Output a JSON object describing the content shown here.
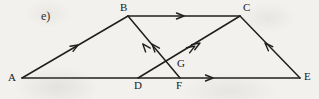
{
  "figure": {
    "part_label": "e)",
    "width": 319,
    "height": 99,
    "background_color": "#f2f1ee",
    "ink_color": "#1f1f1f"
  },
  "vertices": [
    {
      "id": "A",
      "label": "A",
      "x": 22,
      "y": 78,
      "label_x": 8,
      "label_y": 73
    },
    {
      "id": "B",
      "label": "B",
      "x": 128,
      "y": 16,
      "label_x": 120,
      "label_y": 3
    },
    {
      "id": "C",
      "label": "C",
      "x": 240,
      "y": 16,
      "label_x": 243,
      "label_y": 3
    },
    {
      "id": "D",
      "label": "D",
      "x": 138,
      "y": 78,
      "label_x": 134,
      "label_y": 81
    },
    {
      "id": "E",
      "label": "E",
      "x": 300,
      "y": 78,
      "label_x": 304,
      "label_y": 72
    },
    {
      "id": "F",
      "label": "F",
      "x": 180,
      "y": 78,
      "label_x": 176,
      "label_y": 81
    },
    {
      "id": "G",
      "label": "G",
      "x": 175,
      "y": 59,
      "label_x": 177,
      "label_y": 60
    }
  ],
  "edges": [
    {
      "id": "AB",
      "from": "A",
      "to": "B",
      "arrow_at": 0.53,
      "arrow_label": "single-arrow-toward-B"
    },
    {
      "id": "BC",
      "from": "B",
      "to": "C",
      "arrow_at": 0.49,
      "arrow_label": "single-arrow-toward-C"
    },
    {
      "id": "AE",
      "from": "A",
      "to": "E",
      "arrow_at": 0.0,
      "arrow_label": "no-arrow"
    },
    {
      "id": "FE",
      "from": "F",
      "to": "E",
      "arrow_at": 0.27,
      "arrow_label": "single-arrow-toward-E"
    },
    {
      "id": "CE",
      "from": "E",
      "to": "C",
      "arrow_at": 0.57,
      "arrow_label": "single-arrow-toward-C"
    },
    {
      "id": "FB",
      "from": "F",
      "to": "B",
      "arrow_at": 0.55,
      "arrow_label": "double-arrow-toward-B"
    },
    {
      "id": "DC",
      "from": "D",
      "to": "C",
      "arrow_at": 0.59,
      "arrow_label": "double-arrow-toward-C"
    }
  ],
  "intersection": {
    "id": "G",
    "label": "G",
    "of_edges": [
      "FB",
      "DC"
    ]
  }
}
